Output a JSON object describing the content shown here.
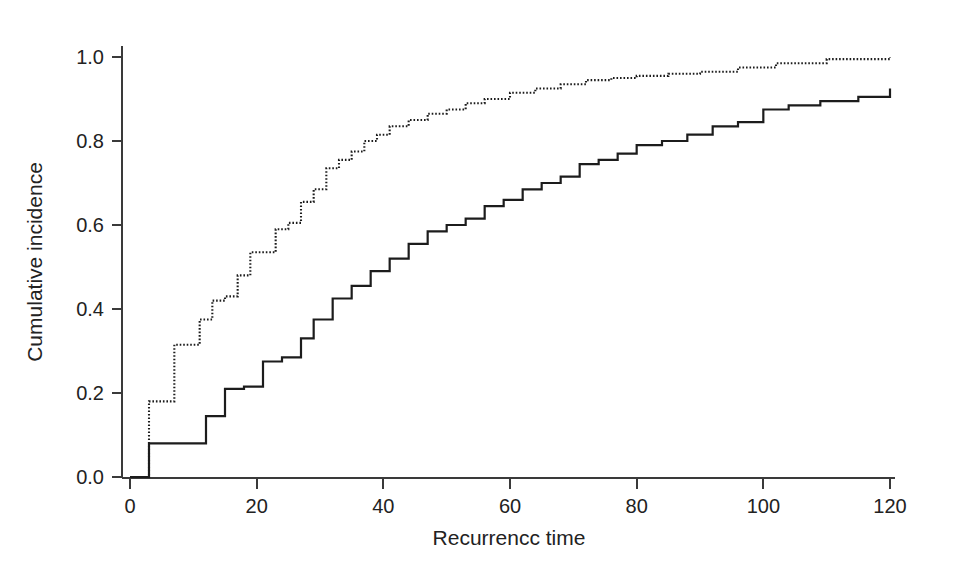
{
  "chart_data": {
    "type": "line",
    "title": "",
    "subtitle": "",
    "xlabel": "Recurrencc time",
    "ylabel": "Cumulative incidence",
    "xlim": [
      0,
      122
    ],
    "ylim": [
      0.0,
      1.02
    ],
    "xticks": [
      0,
      20,
      40,
      60,
      80,
      100,
      120
    ],
    "xtick_labels": [
      "0",
      "20",
      "40",
      "60",
      "80",
      "100",
      "120"
    ],
    "yticks": [
      0.0,
      0.2,
      0.4,
      0.6,
      0.8,
      1.0
    ],
    "ytick_labels": [
      "0.0",
      "0.2",
      "0.4",
      "0.6",
      "0.8",
      "1.0"
    ],
    "grid": false,
    "legend": "none",
    "axis_style": "left-and-bottom-spines",
    "curve_color": "#1c1c1c",
    "series": [
      {
        "name": "dotted-curve",
        "style": "dotted",
        "step": "post",
        "x": [
          0,
          3,
          3,
          5,
          7,
          9,
          11,
          13,
          15,
          17,
          19,
          21,
          23,
          25,
          27,
          29,
          31,
          33,
          35,
          37,
          39,
          41,
          44,
          47,
          50,
          53,
          56,
          60,
          64,
          68,
          72,
          76,
          80,
          85,
          90,
          96,
          102,
          110,
          120
        ],
        "y": [
          0.0,
          0.0,
          0.18,
          0.18,
          0.315,
          0.315,
          0.375,
          0.42,
          0.43,
          0.48,
          0.535,
          0.535,
          0.59,
          0.605,
          0.655,
          0.685,
          0.735,
          0.755,
          0.775,
          0.8,
          0.815,
          0.835,
          0.85,
          0.865,
          0.875,
          0.89,
          0.9,
          0.915,
          0.925,
          0.935,
          0.945,
          0.95,
          0.955,
          0.96,
          0.965,
          0.975,
          0.985,
          0.995,
          1.0
        ]
      },
      {
        "name": "solid-curve",
        "style": "solid",
        "step": "post",
        "x": [
          0,
          3,
          3,
          8,
          12,
          15,
          18,
          21,
          24,
          27,
          29,
          32,
          35,
          38,
          41,
          44,
          47,
          50,
          53,
          56,
          59,
          62,
          65,
          68,
          71,
          74,
          77,
          80,
          84,
          88,
          92,
          96,
          100,
          104,
          109,
          115,
          120
        ],
        "y": [
          0.0,
          0.0,
          0.08,
          0.08,
          0.145,
          0.21,
          0.215,
          0.275,
          0.285,
          0.33,
          0.375,
          0.425,
          0.455,
          0.49,
          0.52,
          0.555,
          0.585,
          0.6,
          0.615,
          0.645,
          0.66,
          0.685,
          0.7,
          0.715,
          0.745,
          0.755,
          0.77,
          0.79,
          0.8,
          0.815,
          0.835,
          0.845,
          0.875,
          0.885,
          0.895,
          0.905,
          0.925
        ]
      }
    ]
  },
  "axes": {
    "ylabel_text": "Cumulative incidence",
    "xlabel_text": "Recurrencc time"
  }
}
